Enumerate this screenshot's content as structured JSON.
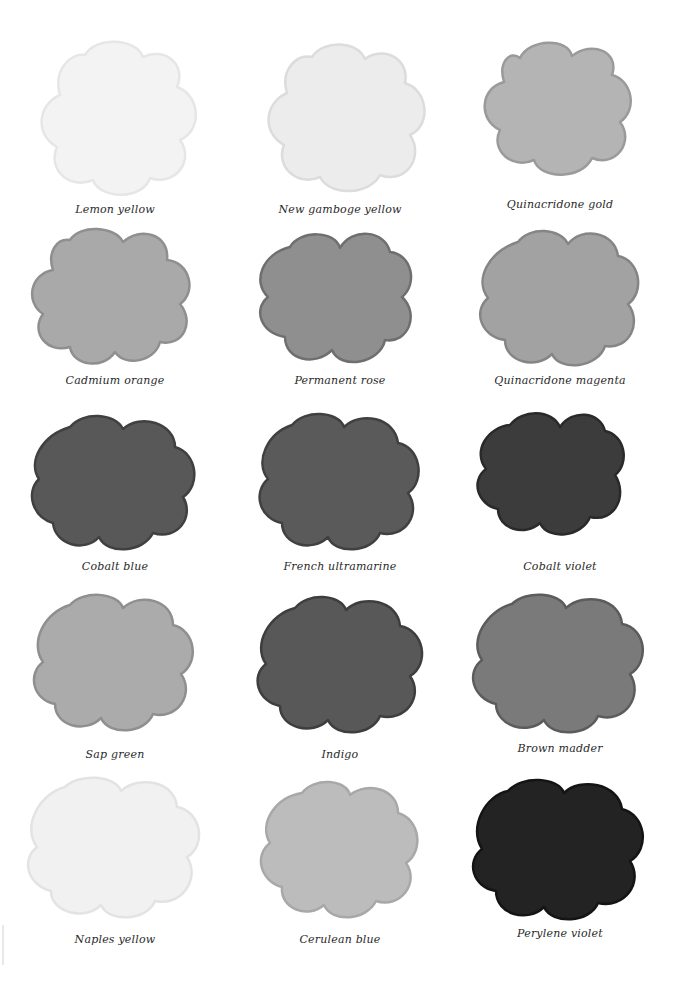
{
  "plate": {
    "swatches": [
      {
        "label": "Lemon yellow",
        "fill": "#f3f3f3",
        "edge": "#e6e6e6",
        "blot": "#ececec"
      },
      {
        "label": "New gamboge yellow",
        "fill": "#ececec",
        "edge": "#dcdcdc",
        "blot": "#e2e2e2"
      },
      {
        "label": "Quinacridone gold",
        "fill": "#b4b4b4",
        "edge": "#9a9a9a",
        "blot": "#a6a6a6"
      },
      {
        "label": "Cadmium orange",
        "fill": "#a9a9a9",
        "edge": "#8f8f8f",
        "blot": "#9d9d9d"
      },
      {
        "label": "Permanent rose",
        "fill": "#8f8f8f",
        "edge": "#6f6f6f",
        "blot": "#5e5e5e"
      },
      {
        "label": "Quinacridone magenta",
        "fill": "#a2a2a2",
        "edge": "#858585",
        "blot": "#979797"
      },
      {
        "label": "Cobalt blue",
        "fill": "#585858",
        "edge": "#404040",
        "blot": "#4a4a4a"
      },
      {
        "label": "French ultramarine",
        "fill": "#5a5a5a",
        "edge": "#404040",
        "blot": "#4b4b4b"
      },
      {
        "label": "Cobalt violet",
        "fill": "#3c3c3c",
        "edge": "#2a2a2a",
        "blot": "#303030"
      },
      {
        "label": "Sap green",
        "fill": "#ababab",
        "edge": "#8f8f8f",
        "blot": "#9e9e9e"
      },
      {
        "label": "Indigo",
        "fill": "#585858",
        "edge": "#3e3e3e",
        "blot": "#4a4a4a"
      },
      {
        "label": "Brown madder",
        "fill": "#7a7a7a",
        "edge": "#5c5c5c",
        "blot": "#5a5a5a"
      },
      {
        "label": "Naples yellow",
        "fill": "#f1f1f1",
        "edge": "#e3e3e3",
        "blot": "#ebebeb"
      },
      {
        "label": "Cerulean blue",
        "fill": "#bcbcbc",
        "edge": "#a8a8a8",
        "blot": "#a0a0a0"
      },
      {
        "label": "Perylene violet",
        "fill": "#232323",
        "edge": "#141414",
        "blot": "#2e2e2e"
      }
    ]
  }
}
